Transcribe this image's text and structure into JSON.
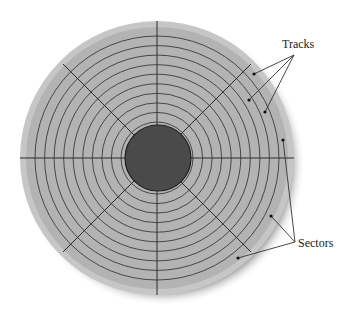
{
  "diagram": {
    "labels": {
      "tracks": "Tracks",
      "sectors": "Sectors"
    },
    "disk": {
      "center": [
        157,
        158
      ],
      "outer_radius": 137,
      "hub_radius": 33,
      "track_count": 10,
      "sector_lines": 8,
      "colors": {
        "platter": "#b3b3b3",
        "platter_edge": "#c6c6c6",
        "hub": "#4a4a4a",
        "lines": "#333333",
        "shadow": "#7a7a7a"
      }
    },
    "callouts": {
      "tracks": {
        "origin": [
          294,
          55
        ],
        "points": [
          [
            254,
            74
          ],
          [
            249,
            100
          ],
          [
            265,
            112
          ]
        ]
      },
      "sectors": {
        "origin": [
          295,
          242
        ],
        "points": [
          [
            283,
            140
          ],
          [
            271,
            216
          ],
          [
            238,
            258
          ]
        ]
      }
    }
  }
}
